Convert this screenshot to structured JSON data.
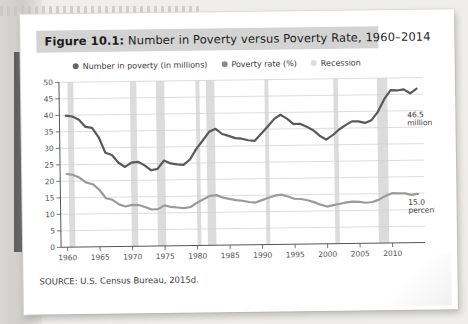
{
  "figure": {
    "label": "Figure 10.1:",
    "title": " Number in Poverty versus Poverty Rate, 1960–2014",
    "source": "SOURCE: U.S. Census Bureau, 2015d."
  },
  "legend": [
    {
      "name": "series-number-in-poverty",
      "label": "Number in poverty (in millions)",
      "color": "#666666"
    },
    {
      "name": "series-poverty-rate",
      "label": "Poverty rate (%)",
      "color": "#8c8c8c"
    },
    {
      "name": "series-recession",
      "label": "Recession",
      "color": "#d8d8d8"
    }
  ],
  "colors": {
    "number_line": "#595959",
    "rate_line": "#9a9a9a",
    "recession_band": "#dcdcdc",
    "grid": "#cfcfcf",
    "axis": "#555555",
    "title_bar": "#d3d3d3"
  },
  "annotations": [
    {
      "name": "annotation-number",
      "line1": "46.5",
      "line2": "million",
      "x": 2012.5,
      "y": 38.0
    },
    {
      "name": "annotation-rate",
      "line1": "15.0",
      "line2": "percent",
      "x": 2012.5,
      "y": 11.5
    }
  ],
  "chart_data": {
    "type": "line",
    "xlabel": "",
    "ylabel": "",
    "xlim": [
      1959,
      2015
    ],
    "ylim": [
      0,
      50
    ],
    "yticks": [
      0,
      5,
      10,
      15,
      20,
      25,
      30,
      35,
      40,
      45,
      50
    ],
    "xticks": [
      1960,
      1965,
      1970,
      1975,
      1980,
      1985,
      1990,
      1995,
      2000,
      2005,
      2010
    ],
    "grid": true,
    "legend_position": "top",
    "x": [
      1960,
      1961,
      1962,
      1963,
      1964,
      1965,
      1966,
      1967,
      1968,
      1969,
      1970,
      1971,
      1972,
      1973,
      1974,
      1975,
      1976,
      1977,
      1978,
      1979,
      1980,
      1981,
      1982,
      1983,
      1984,
      1985,
      1986,
      1987,
      1988,
      1989,
      1990,
      1991,
      1992,
      1993,
      1994,
      1995,
      1996,
      1997,
      1998,
      1999,
      2000,
      2001,
      2002,
      2003,
      2004,
      2005,
      2006,
      2007,
      2008,
      2009,
      2010,
      2011,
      2012,
      2013,
      2014
    ],
    "series": [
      {
        "name": "Number in poverty (in millions)",
        "unit": "millions",
        "color": "#595959",
        "values": [
          39.9,
          39.6,
          38.6,
          36.4,
          36.1,
          33.2,
          28.5,
          27.8,
          25.4,
          24.1,
          25.4,
          25.6,
          24.5,
          23.0,
          23.4,
          25.9,
          25.0,
          24.7,
          24.5,
          26.1,
          29.3,
          31.8,
          34.4,
          35.3,
          33.7,
          33.1,
          32.4,
          32.2,
          31.7,
          31.5,
          33.6,
          35.7,
          38.0,
          39.3,
          38.1,
          36.4,
          36.5,
          35.6,
          34.5,
          32.8,
          31.6,
          32.9,
          34.6,
          35.9,
          37.0,
          37.0,
          36.5,
          37.3,
          39.8,
          43.6,
          46.3,
          46.2,
          46.5,
          45.3,
          46.7
        ],
        "last_value": 46.5
      },
      {
        "name": "Poverty rate (%)",
        "unit": "percent",
        "color": "#9a9a9a",
        "values": [
          22.2,
          21.9,
          21.0,
          19.5,
          19.0,
          17.3,
          14.7,
          14.2,
          12.8,
          12.1,
          12.6,
          12.5,
          11.9,
          11.1,
          11.2,
          12.3,
          11.8,
          11.6,
          11.4,
          11.7,
          13.0,
          14.0,
          15.0,
          15.2,
          14.4,
          14.0,
          13.6,
          13.4,
          13.0,
          12.8,
          13.5,
          14.2,
          14.8,
          15.1,
          14.5,
          13.8,
          13.7,
          13.3,
          12.7,
          11.9,
          11.3,
          11.7,
          12.1,
          12.5,
          12.7,
          12.6,
          12.3,
          12.5,
          13.2,
          14.3,
          15.1,
          15.0,
          15.0,
          14.5,
          14.8
        ],
        "last_value": 15.0
      }
    ],
    "recessions": [
      {
        "start": 1960.3,
        "end": 1961.2
      },
      {
        "start": 1969.9,
        "end": 1970.9
      },
      {
        "start": 1973.9,
        "end": 1975.2
      },
      {
        "start": 1980.0,
        "end": 1980.6
      },
      {
        "start": 1981.6,
        "end": 1982.9
      },
      {
        "start": 1990.6,
        "end": 1991.2
      },
      {
        "start": 2001.2,
        "end": 2001.9
      },
      {
        "start": 2007.9,
        "end": 2009.5
      }
    ]
  }
}
